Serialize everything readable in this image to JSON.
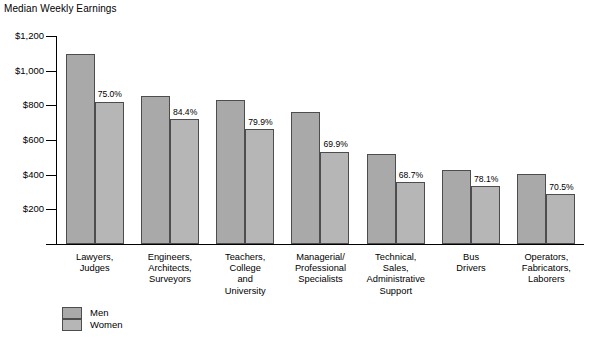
{
  "chart_data": {
    "type": "bar",
    "title": "Median Weekly Earnings",
    "xlabel": "",
    "ylabel": "Median Weekly Earnings",
    "ylim": [
      0,
      1200
    ],
    "grid": false,
    "legend_position": "bottom-left",
    "ytick_labels": [
      "$1,200",
      "$1,000",
      "$800",
      "$600",
      "$400",
      "$200"
    ],
    "ytick_values": [
      1200,
      1000,
      800,
      600,
      400,
      200
    ],
    "categories": [
      "Lawyers,\nJudges",
      "Engineers,\nArchitects,\nSurveyors",
      "Teachers,\nCollege\nand\nUniversity",
      "Managerial/\nProfessional\nSpecialists",
      "Technical,\nSales,\nAdministrative\nSupport",
      "Bus\nDrivers",
      "Operators,\nFabricators,\nLaborers"
    ],
    "series": [
      {
        "name": "Men",
        "color": "#a9a9a9",
        "values": [
          1095,
          852,
          830,
          763,
          520,
          428,
          405
        ]
      },
      {
        "name": "Women",
        "color": "#b6b6b6",
        "values": [
          821,
          719,
          663,
          533,
          357,
          334,
          286
        ]
      }
    ],
    "annotations": [
      "75.0%",
      "84.4%",
      "79.9%",
      "69.9%",
      "68.7%",
      "78.1%",
      "70.5%"
    ]
  },
  "legend": {
    "men_label": "Men",
    "women_label": "Women"
  }
}
